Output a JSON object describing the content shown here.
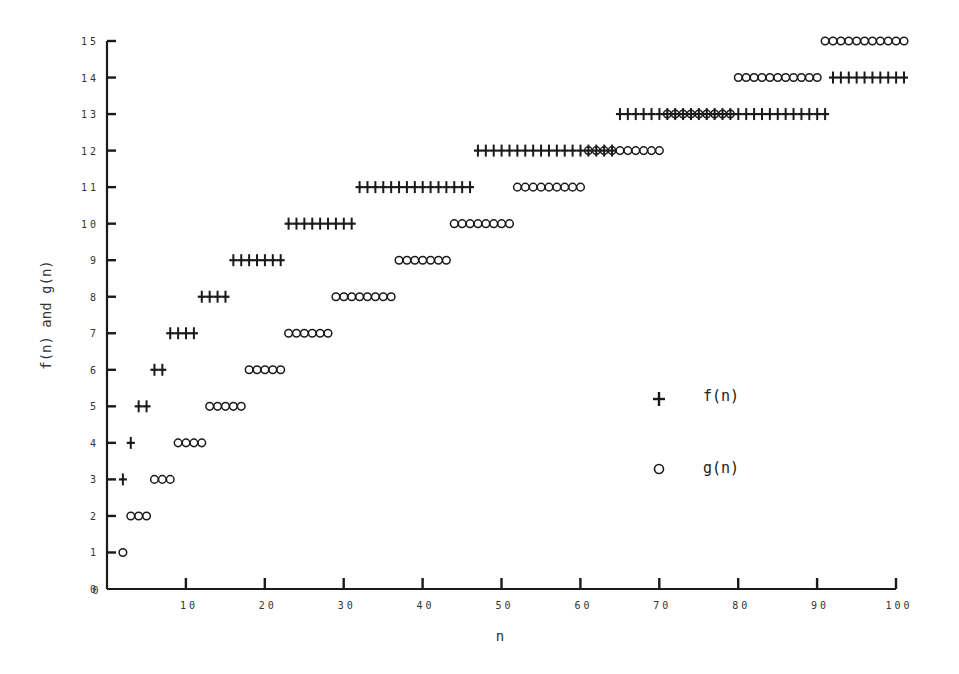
{
  "chart_data": {
    "type": "scatter",
    "title": "",
    "xlabel": "n",
    "ylabel": "f(n) and g(n)",
    "xlim": [
      0,
      100
    ],
    "ylim": [
      0,
      15
    ],
    "grid": false,
    "legend_position": "right-center",
    "x_ticks": [
      0,
      10,
      20,
      30,
      40,
      50,
      60,
      70,
      80,
      90,
      100
    ],
    "y_ticks": [
      0,
      1,
      2,
      3,
      4,
      5,
      6,
      7,
      8,
      9,
      10,
      11,
      12,
      13,
      14,
      15
    ],
    "series": [
      {
        "name": "f(n)",
        "marker": "+",
        "step_ranges": [
          {
            "value": 3,
            "n_from": 1,
            "n_to": 1
          },
          {
            "value": 4,
            "n_from": 2,
            "n_to": 2
          },
          {
            "value": 5,
            "n_from": 3,
            "n_to": 4
          },
          {
            "value": 6,
            "n_from": 5,
            "n_to": 6
          },
          {
            "value": 7,
            "n_from": 7,
            "n_to": 10
          },
          {
            "value": 8,
            "n_from": 11,
            "n_to": 14
          },
          {
            "value": 9,
            "n_from": 15,
            "n_to": 21
          },
          {
            "value": 10,
            "n_from": 22,
            "n_to": 30
          },
          {
            "value": 11,
            "n_from": 31,
            "n_to": 45
          },
          {
            "value": 12,
            "n_from": 46,
            "n_to": 63
          },
          {
            "value": 13,
            "n_from": 64,
            "n_to": 90
          },
          {
            "value": 14,
            "n_from": 91,
            "n_to": 100
          }
        ]
      },
      {
        "name": "g(n)",
        "marker": "o",
        "step_ranges": [
          {
            "value": 1,
            "n_from": 1,
            "n_to": 1
          },
          {
            "value": 2,
            "n_from": 2,
            "n_to": 4
          },
          {
            "value": 3,
            "n_from": 5,
            "n_to": 7
          },
          {
            "value": 4,
            "n_from": 8,
            "n_to": 11
          },
          {
            "value": 5,
            "n_from": 12,
            "n_to": 16
          },
          {
            "value": 6,
            "n_from": 17,
            "n_to": 21
          },
          {
            "value": 7,
            "n_from": 22,
            "n_to": 27
          },
          {
            "value": 8,
            "n_from": 28,
            "n_to": 35
          },
          {
            "value": 9,
            "n_from": 36,
            "n_to": 42
          },
          {
            "value": 10,
            "n_from": 43,
            "n_to": 50
          },
          {
            "value": 11,
            "n_from": 51,
            "n_to": 59
          },
          {
            "value": 12,
            "n_from": 60,
            "n_to": 69
          },
          {
            "value": 13,
            "n_from": 70,
            "n_to": 78
          },
          {
            "value": 14,
            "n_from": 79,
            "n_to": 89
          },
          {
            "value": 15,
            "n_from": 90,
            "n_to": 100
          }
        ]
      }
    ],
    "legend": [
      {
        "symbol": "+",
        "label": "f(n)"
      },
      {
        "symbol": "o",
        "label": "g(n)"
      }
    ]
  },
  "colors": {
    "ink": "#1a1a1a",
    "background": "#ffffff"
  }
}
